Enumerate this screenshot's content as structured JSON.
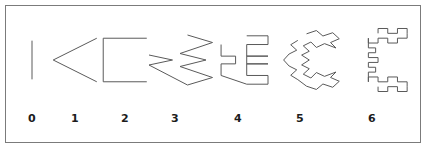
{
  "figure": {
    "background_color": "#ffffff",
    "border_color": "#7b7b7b",
    "stroke_color": "#5a5a5a",
    "label_color": "#1c1c1c",
    "stroke_width": 1
  },
  "chart_data": {
    "type": "line",
    "subtitle": "",
    "xlabel": "",
    "ylabel": "",
    "grid": false,
    "legend": "none",
    "iterations": [
      {
        "label": "0",
        "segment_count": 1,
        "viewbox": "-0.62 -0.05 1.24 1.1",
        "points": "0,0 0,1",
        "shape": "vertical line segment"
      },
      {
        "label": "1",
        "segment_count": 2,
        "viewbox": "-0.62 -0.05 1.24 1.1",
        "points": "0.5,0 -0.5,0.5 0.5,1",
        "shape": "left-pointing chevron"
      },
      {
        "label": "2",
        "segment_count": 4,
        "viewbox": "-0.62 -0.05 1.24 1.1",
        "points": "0.5,0 -0.5,0 -0.5,1 0.5,1",
        "shape": "open bracket"
      },
      {
        "label": "3",
        "segment_count": 8,
        "viewbox": "-0.62 -0.05 1.24 1.1",
        "points": "0.25,0 0.75,0.15 0.1,0.37 0.62,0.5 0.1,0.63 0.75,0.85 0.25,1 -0.52,0.6 -0.05,0.5 -0.52,0.4",
        "shape": "diagonal zigzag"
      },
      {
        "label": "4",
        "segment_count": 16,
        "viewbox": "-0.62 -0.05 1.24 1.1",
        "points": "0.18,0 0.62,0 0.62,0.18 0.18,0.18 0.18,0.42 0.62,0.42 0.18,0.42 0.18,0.58 0.62,0.58 0.18,0.58 0.18,0.82 0.62,0.82 0.62,1 0.18,1 -0.35,0.82 -0.35,0.58 -0.05,0.58 -0.05,0.42 -0.35,0.42 -0.35,0.18",
        "shape": "rectilinear blocky outline with notches"
      },
      {
        "label": "5",
        "segment_count": 32,
        "viewbox": "-0.66 -0.05 1.32 1.1",
        "points": "0.12,0.02 0.3,-0.04 0.42,0.06 0.6,0.0 0.72,0.11 0.56,0.18 0.66,0.28 0.45,0.2 0.3,0.27 0.2,0.17 0.06,0.24 0.17,0.34 0.03,0.41 0.17,0.5 0.03,0.59 0.17,0.66 0.06,0.76 0.2,0.83 0.3,0.73 0.45,0.8 0.66,0.72 0.56,0.82 0.72,0.89 0.6,1.0 0.42,0.94 0.3,1.04 0.12,0.98 -0.04,0.86 -0.17,0.78 -0.06,0.68 -0.2,0.61 -0.3,0.5 -0.2,0.39 -0.06,0.32 -0.17,0.22 -0.04,0.14",
        "shape": "diagonal zigzag with central diamond"
      },
      {
        "label": "6",
        "segment_count": 64,
        "viewbox": "-0.66 -0.05 1.32 1.1",
        "points": "0.1,0.06 0.1,-0.02 0.26,-0.02 0.26,0.06 0.42,0.06 0.42,-0.02 0.58,-0.02 0.58,0.06 0.58,0.14 0.42,0.14 0.42,0.22 0.26,0.22 0.26,0.14 0.1,0.14 0.1,0.22 -0.06,0.22 -0.06,0.14 -0.06,0.3 0.06,0.3 0.06,0.38 -0.06,0.38 -0.06,0.46 0.1,0.46 0.1,0.54 -0.06,0.54 -0.06,0.62 0.06,0.62 0.06,0.7 -0.06,0.7 -0.06,0.86 -0.06,0.78 0.1,0.78 0.1,0.86 0.26,0.86 0.26,0.78 0.42,0.78 0.42,0.86 0.58,0.86 0.58,0.94 0.58,1.02 0.42,1.02 0.42,0.94 0.26,0.94 0.26,1.02 0.1,1.02 0.1,0.94",
        "shape": "rectilinear outline with three inner squares"
      }
    ]
  },
  "labels": {
    "items": [
      "0",
      "1",
      "2",
      "3",
      "4",
      "5",
      "6"
    ]
  }
}
